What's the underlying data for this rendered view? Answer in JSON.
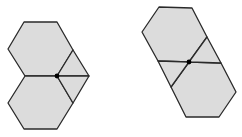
{
  "colors": {
    "fill": "#dcdcdc",
    "stroke": "#2a2a2a",
    "dot": "#000000",
    "background": "#ffffff"
  },
  "figures": [
    {
      "name": "left-figure",
      "description": "Two stacked hexagons sharing a horizontal edge, with a rhombus (two triangles) attached on the right, meeting at a marked center point",
      "center_dot": [
        57,
        76
      ],
      "polygons": [
        "24,22 57,22 73,50 57,76 25,76 8,49",
        "25,76 57,76 73,103 57,129 24,129 8,103",
        "73,50 89,76 57,76",
        "57,76 89,76 73,103"
      ]
    },
    {
      "name": "right-figure",
      "description": "Two hexagons arranged diagonally with two triangles filling the gaps, meeting at a marked center point",
      "center_dot": [
        189,
        62
      ],
      "polygons": [
        "159,7 192,8 207,37 189,62 158,61 142,32",
        "189,62 221,63 236,92 219,117 186,117 171,87",
        "207,37 221,63 189,62",
        "158,61 189,62 171,87"
      ]
    }
  ]
}
